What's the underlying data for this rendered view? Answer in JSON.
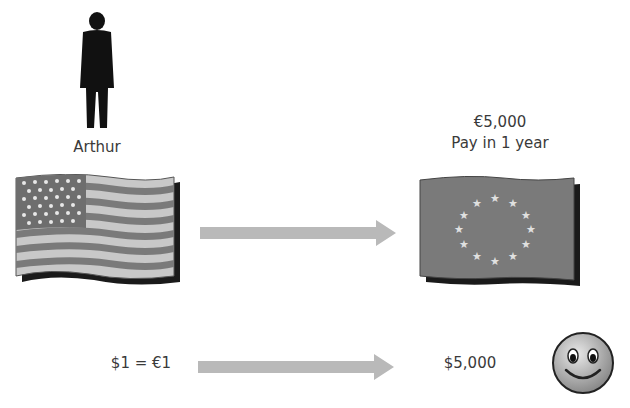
{
  "person": {
    "name": "Arthur",
    "icon": "person-silhouette-icon"
  },
  "top_right": {
    "amount": "€5,000",
    "note": "Pay in 1 year"
  },
  "flags": {
    "left": "us-flag-icon",
    "right": "eu-flag-icon"
  },
  "bottom": {
    "rate": "$1 = €1",
    "result": "$5,000",
    "mood_icon": "smiley-face-icon"
  },
  "colors": {
    "arrow": "#b9b9b9",
    "flag_dark": "#7a7a7a",
    "flag_light": "#c8c8c8",
    "shadow": "#1a1a1a"
  }
}
